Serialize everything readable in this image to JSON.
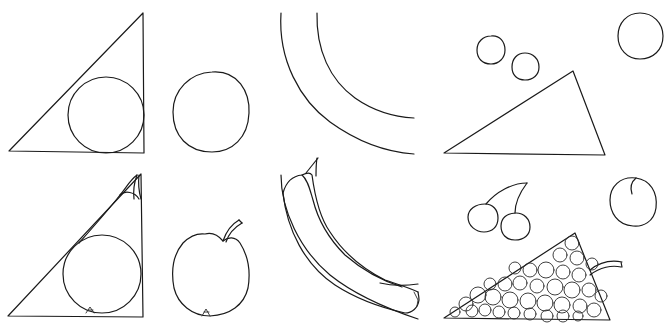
{
  "illustration": {
    "description": "Line drawing worksheet: geometric shapes (top row) transformed into fruits (bottom row)",
    "stroke_color": "#1a1a1a",
    "background": "#ffffff",
    "panels": [
      {
        "id": "triangle-circle",
        "row": "top",
        "subject": "right triangle with inscribed circle"
      },
      {
        "id": "circle",
        "row": "top",
        "subject": "circle"
      },
      {
        "id": "arcs",
        "row": "top",
        "subject": "two concentric arcs"
      },
      {
        "id": "circles-triangle",
        "row": "top",
        "subject": "three small circles, large circle and triangle"
      },
      {
        "id": "pear",
        "row": "bottom",
        "subject": "pear drawn from triangle and circle"
      },
      {
        "id": "apple",
        "row": "bottom",
        "subject": "apple drawn from circle"
      },
      {
        "id": "banana",
        "row": "bottom",
        "subject": "banana drawn from arcs"
      },
      {
        "id": "cherries-peach-grapes",
        "row": "bottom",
        "subject": "cherries, peach and bunch of grapes"
      }
    ]
  }
}
